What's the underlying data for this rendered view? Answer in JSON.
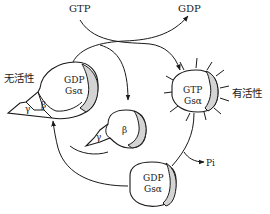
{
  "diagram": {
    "title": "",
    "type": "G-protein activation cycle",
    "labels": {
      "gtp_top": "GTP",
      "gdp_top": "GDP",
      "inactive": "无活性",
      "active": "有活性",
      "pi": "Pi"
    },
    "nodes": {
      "inactive_complex": {
        "alpha_nucleotide": "GDP",
        "alpha_name": "Gsα",
        "beta": "β",
        "gamma": "γ"
      },
      "active_alpha": {
        "nucleotide": "GTP",
        "name": "Gsα"
      },
      "free_beta_gamma": {
        "beta": "β",
        "gamma": "γ"
      },
      "hydrolyzed_alpha": {
        "nucleotide": "GDP",
        "name": "Gsα"
      }
    },
    "colors": {
      "stroke": "#1a1a1a",
      "shade": "#d4d4d4",
      "background": "#ffffff"
    }
  }
}
